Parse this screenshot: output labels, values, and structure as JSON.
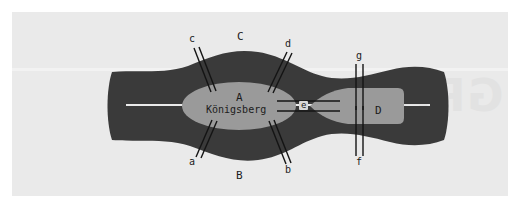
{
  "figure": {
    "city_label": "Königsberg",
    "watermark_text": "GRAD"
  },
  "colors": {
    "page_background": "#ffffff",
    "canvas_background": "#eaeaea",
    "land": "#3a3a3a",
    "island": "#9a9a9a",
    "bridge_line": "#141414",
    "label_text": "#1c1c1c",
    "watermark": "#e2e2e2"
  },
  "regions": [
    {
      "id": "A",
      "label": "A",
      "description": "central island",
      "x": 239,
      "y": 98
    },
    {
      "id": "B",
      "label": "B",
      "description": "south bank",
      "x": 239,
      "y": 176
    },
    {
      "id": "C",
      "label": "C",
      "description": "north bank",
      "x": 240,
      "y": 38
    },
    {
      "id": "D",
      "label": "D",
      "description": "east island",
      "x": 378,
      "y": 112
    }
  ],
  "bridges": [
    {
      "id": "a",
      "label": "a",
      "connects": [
        "A",
        "B"
      ],
      "x": 192,
      "y": 163
    },
    {
      "id": "b",
      "label": "b",
      "connects": [
        "A",
        "B"
      ],
      "x": 288,
      "y": 171
    },
    {
      "id": "c",
      "label": "c",
      "connects": [
        "A",
        "C"
      ],
      "x": 192,
      "y": 40
    },
    {
      "id": "d",
      "label": "d",
      "connects": [
        "A",
        "C"
      ],
      "x": 288,
      "y": 45
    },
    {
      "id": "e",
      "label": "e",
      "connects": [
        "A",
        "D"
      ],
      "x": 303,
      "y": 106
    },
    {
      "id": "f",
      "label": "f",
      "connects": [
        "B",
        "D"
      ],
      "x": 359,
      "y": 163
    },
    {
      "id": "g",
      "label": "g",
      "connects": [
        "C",
        "D"
      ],
      "x": 359,
      "y": 57
    }
  ],
  "city": {
    "name": "Königsberg",
    "x": 239,
    "y": 111
  }
}
